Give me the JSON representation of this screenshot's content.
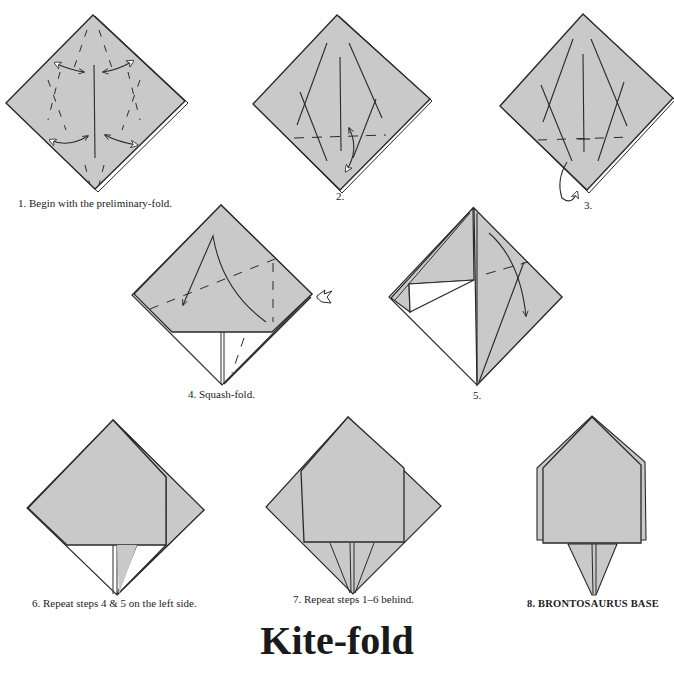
{
  "title": "Kite-fold",
  "colors": {
    "paper_fill": "#c9c9c9",
    "paper_back": "#ffffff",
    "line": "#2a2a2a",
    "background": "#ffffff"
  },
  "steps": [
    {
      "number": "1.",
      "caption": "1.  Begin with the preliminary-fold."
    },
    {
      "number": "2.",
      "caption": "2."
    },
    {
      "number": "3.",
      "caption": "3."
    },
    {
      "number": "4.",
      "caption": "4.  Squash-fold."
    },
    {
      "number": "5.",
      "caption": "5."
    },
    {
      "number": "6.",
      "caption": "6.  Repeat steps 4 & 5 on the left side."
    },
    {
      "number": "7.",
      "caption": "7.  Repeat steps 1–6 behind."
    },
    {
      "number": "8.",
      "caption": "8.  BRONTOSAURUS BASE"
    }
  ],
  "icons": {
    "valley_fold_arrow": "double-headed-curved-arrow",
    "mountain_fold_arrow": "loop-arrow",
    "squash_arrow": "push-arrow"
  }
}
